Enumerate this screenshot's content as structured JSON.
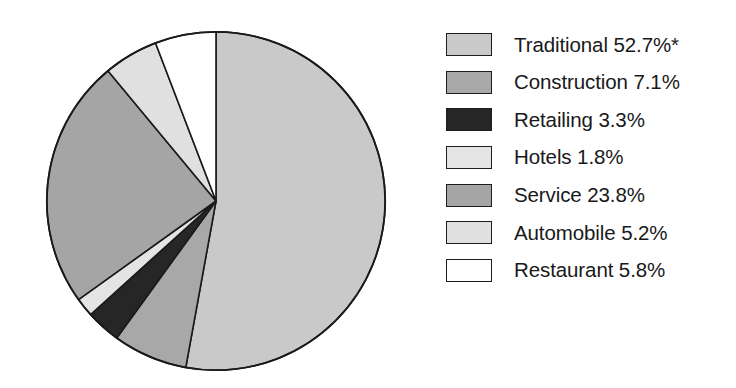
{
  "chart_data": {
    "type": "pie",
    "title": "",
    "subtitle": "",
    "xlabel": "",
    "ylabel": "",
    "legend_position": "right",
    "grid": false,
    "start_angle_deg": 0,
    "direction": "clockwise",
    "categories": [
      "Traditional",
      "Construction",
      "Retailing",
      "Hotels",
      "Service",
      "Automobile",
      "Restaurant"
    ],
    "values": [
      52.7,
      7.1,
      3.3,
      1.8,
      23.8,
      5.2,
      5.8
    ],
    "value_suffix": "%",
    "annotations": [
      "*"
    ],
    "slices": [
      {
        "label": "Traditional",
        "value": 52.7,
        "value_text": "52.7%",
        "label_text": "Traditional 52.7%*",
        "color": "#c9c9c9",
        "note": "*"
      },
      {
        "label": "Construction",
        "value": 7.1,
        "value_text": "7.1%",
        "label_text": "Construction 7.1%",
        "color": "#a8a8a8",
        "note": ""
      },
      {
        "label": "Retailing",
        "value": 3.3,
        "value_text": "3.3%",
        "label_text": "Retailing 3.3%",
        "color": "#262626",
        "note": ""
      },
      {
        "label": "Hotels",
        "value": 1.8,
        "value_text": "1.8%",
        "label_text": "Hotels 1.8%",
        "color": "#e4e4e4",
        "note": ""
      },
      {
        "label": "Service",
        "value": 23.8,
        "value_text": "23.8%",
        "label_text": "Service 23.8%",
        "color": "#a5a5a5",
        "note": ""
      },
      {
        "label": "Automobile",
        "value": 5.2,
        "value_text": "5.2%",
        "label_text": "Automobile 5.2%",
        "color": "#e0e0e0",
        "note": ""
      },
      {
        "label": "Restaurant",
        "value": 5.8,
        "value_text": "5.8%",
        "label_text": "Restaurant 5.8%",
        "color": "#ffffff",
        "note": ""
      }
    ]
  },
  "legend": {
    "items": [
      {
        "label_text": "Traditional 52.7%*",
        "color": "#c9c9c9"
      },
      {
        "label_text": "Construction 7.1%",
        "color": "#a8a8a8"
      },
      {
        "label_text": "Retailing 3.3%",
        "color": "#262626"
      },
      {
        "label_text": "Hotels 1.8%",
        "color": "#e4e4e4"
      },
      {
        "label_text": "Service 23.8%",
        "color": "#a5a5a5"
      },
      {
        "label_text": "Automobile 5.2%",
        "color": "#e0e0e0"
      },
      {
        "label_text": "Restaurant 5.8%",
        "color": "#ffffff"
      }
    ]
  },
  "style": {
    "outline_color": "#1a1a1a",
    "text_color": "#19191a",
    "background": "#ffffff"
  }
}
